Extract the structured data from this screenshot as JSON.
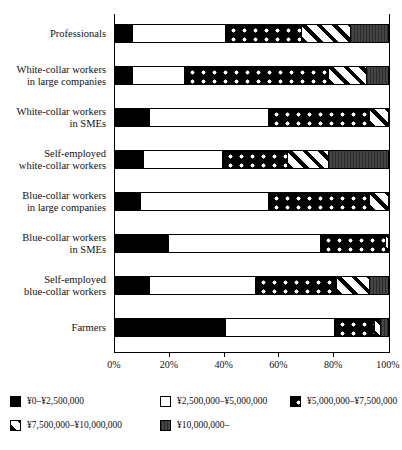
{
  "chart_data": {
    "type": "bar",
    "orientation": "horizontal",
    "stacked": true,
    "normalized": "percent",
    "title": "",
    "xlabel": "",
    "ylabel": "",
    "xlim": [
      0,
      100
    ],
    "grid": false,
    "legend_position": "bottom-left",
    "xticklabels": [
      "0%",
      "20%",
      "40%",
      "60%",
      "80%",
      "100%"
    ],
    "xtickvalues": [
      0,
      20,
      40,
      60,
      80,
      100
    ],
    "categories": [
      "Professionals",
      "White-collar workers in large companies",
      "White-collar workers in SMEs",
      "Self-employed white-collar workers",
      "Blue-collar workers in large companies",
      "Blue-collar workers in SMEs",
      "Self-employed blue-collar workers",
      "Farmers"
    ],
    "category_lines": [
      [
        "Professionals"
      ],
      [
        "White-collar workers",
        "in large companies"
      ],
      [
        "White-collar workers",
        "in SMEs"
      ],
      [
        "Self-employed",
        "white-collar workers"
      ],
      [
        "Blue-collar workers",
        "in large companies"
      ],
      [
        "Blue-collar workers",
        "in SMEs"
      ],
      [
        "Self-employed",
        "blue-collar workers"
      ],
      [
        "Farmers"
      ]
    ],
    "series": [
      {
        "name": "¥0–¥2,500,000",
        "pattern": "solid-black",
        "values": [
          6,
          6,
          12,
          10,
          9,
          19,
          12,
          40
        ]
      },
      {
        "name": "¥2,500,000–¥5,000,000",
        "pattern": "white",
        "values": [
          34,
          19,
          44,
          29,
          47,
          56,
          39,
          40
        ]
      },
      {
        "name": "¥5,000,000–¥7,500,000",
        "pattern": "dots",
        "values": [
          28,
          53,
          37,
          24,
          37,
          24,
          30,
          15
        ]
      },
      {
        "name": "¥7,500,000–¥10,000,000",
        "pattern": "stripes",
        "values": [
          18,
          14,
          7,
          15,
          7,
          1,
          12,
          2
        ]
      },
      {
        "name": "¥10,000,000–",
        "pattern": "dark-gray",
        "values": [
          14,
          8,
          0,
          22,
          0,
          0,
          7,
          3
        ]
      }
    ]
  },
  "legend": {
    "items": [
      {
        "label": "¥0–¥2,500,000",
        "pattern": "solid-black"
      },
      {
        "label": "¥2,500,000–¥5,000,000",
        "pattern": "white"
      },
      {
        "label": "¥5,000,000–¥7,500,000",
        "pattern": "dots"
      },
      {
        "label": "¥7,500,000–¥10,000,000",
        "pattern": "stripes"
      },
      {
        "label": "¥10,000,000–",
        "pattern": "dark-gray"
      }
    ]
  }
}
